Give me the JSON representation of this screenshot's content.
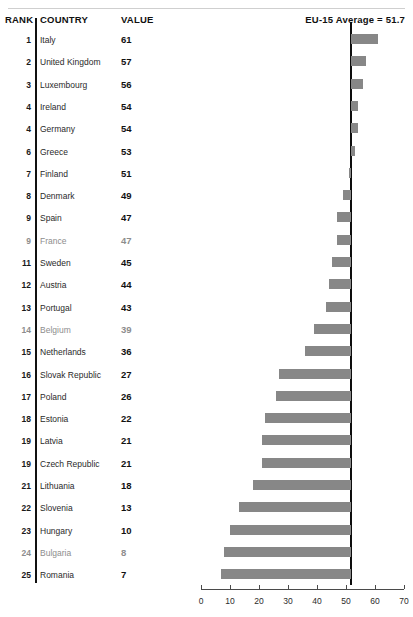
{
  "header": {
    "rank_label": "RANK",
    "country_label": "COUNTRY",
    "value_label": "VALUE",
    "average_label": "EU-15 Average = 51.7"
  },
  "colors": {
    "bar": "#878787",
    "average_line": "#0d0d0d",
    "axis": "#4a4a4a",
    "text": "#1a1a1a",
    "rule": "#cfcfcf"
  },
  "chart_data": {
    "type": "bar",
    "title": "",
    "subtitle": "",
    "xlabel": "",
    "ylabel": "",
    "orientation": "horizontal",
    "baseline": 51.7,
    "baseline_label": "EU-15 Average = 51.7",
    "xlim": [
      0,
      70
    ],
    "xticks": [
      0,
      10,
      20,
      30,
      40,
      50,
      60,
      70
    ],
    "xtick_labels": [
      "0",
      "10",
      "20",
      "30",
      "40",
      "50",
      "60",
      "70"
    ],
    "grid": false,
    "legend": "none",
    "columns": [
      "RANK",
      "COUNTRY",
      "VALUE"
    ],
    "categories": [
      "Italy",
      "United Kingdom",
      "Luxembourg",
      "Ireland",
      "Germany",
      "Greece",
      "Finland",
      "Denmark",
      "Spain",
      "France",
      "Sweden",
      "Austria",
      "Portugal",
      "Belgium",
      "Netherlands",
      "Slovak Republic",
      "Poland",
      "Estonia",
      "Latvia",
      "Czech Republic",
      "Lithuania",
      "Slovenia",
      "Hungary",
      "Bulgaria",
      "Romania"
    ],
    "values": [
      61,
      57,
      56,
      54,
      54,
      53,
      51,
      49,
      47,
      47,
      45,
      44,
      43,
      39,
      36,
      27,
      26,
      22,
      21,
      21,
      18,
      13,
      10,
      8,
      7
    ],
    "ranks": [
      "1",
      "2",
      "3",
      "4",
      "4",
      "6",
      "7",
      "8",
      "9",
      "9",
      "11",
      "12",
      "13",
      "14",
      "15",
      "16",
      "17",
      "18",
      "19",
      "19",
      "21",
      "22",
      "23",
      "24",
      "25"
    ],
    "rows": [
      {
        "rank": "1",
        "country": "Italy",
        "value": "61",
        "num": 61,
        "faded": false
      },
      {
        "rank": "2",
        "country": "United Kingdom",
        "value": "57",
        "num": 57,
        "faded": false
      },
      {
        "rank": "3",
        "country": "Luxembourg",
        "value": "56",
        "num": 56,
        "faded": false
      },
      {
        "rank": "4",
        "country": "Ireland",
        "value": "54",
        "num": 54,
        "faded": false
      },
      {
        "rank": "4",
        "country": "Germany",
        "value": "54",
        "num": 54,
        "faded": false
      },
      {
        "rank": "6",
        "country": "Greece",
        "value": "53",
        "num": 53,
        "faded": false
      },
      {
        "rank": "7",
        "country": "Finland",
        "value": "51",
        "num": 51,
        "faded": false
      },
      {
        "rank": "8",
        "country": "Denmark",
        "value": "49",
        "num": 49,
        "faded": false
      },
      {
        "rank": "9",
        "country": "Spain",
        "value": "47",
        "num": 47,
        "faded": false
      },
      {
        "rank": "9",
        "country": "France",
        "value": "47",
        "num": 47,
        "faded": true
      },
      {
        "rank": "11",
        "country": "Sweden",
        "value": "45",
        "num": 45,
        "faded": false
      },
      {
        "rank": "12",
        "country": "Austria",
        "value": "44",
        "num": 44,
        "faded": false
      },
      {
        "rank": "13",
        "country": "Portugal",
        "value": "43",
        "num": 43,
        "faded": false
      },
      {
        "rank": "14",
        "country": "Belgium",
        "value": "39",
        "num": 39,
        "faded": true
      },
      {
        "rank": "15",
        "country": "Netherlands",
        "value": "36",
        "num": 36,
        "faded": false
      },
      {
        "rank": "16",
        "country": "Slovak Republic",
        "value": "27",
        "num": 27,
        "faded": false
      },
      {
        "rank": "17",
        "country": "Poland",
        "value": "26",
        "num": 26,
        "faded": false
      },
      {
        "rank": "18",
        "country": "Estonia",
        "value": "22",
        "num": 22,
        "faded": false
      },
      {
        "rank": "19",
        "country": "Latvia",
        "value": "21",
        "num": 21,
        "faded": false
      },
      {
        "rank": "19",
        "country": "Czech Republic",
        "value": "21",
        "num": 21,
        "faded": false
      },
      {
        "rank": "21",
        "country": "Lithuania",
        "value": "18",
        "num": 18,
        "faded": false
      },
      {
        "rank": "22",
        "country": "Slovenia",
        "value": "13",
        "num": 13,
        "faded": false
      },
      {
        "rank": "23",
        "country": "Hungary",
        "value": "10",
        "num": 10,
        "faded": false
      },
      {
        "rank": "24",
        "country": "Bulgaria",
        "value": "8",
        "num": 8,
        "faded": true
      },
      {
        "rank": "25",
        "country": "Romania",
        "value": "7",
        "num": 7,
        "faded": false
      }
    ]
  }
}
